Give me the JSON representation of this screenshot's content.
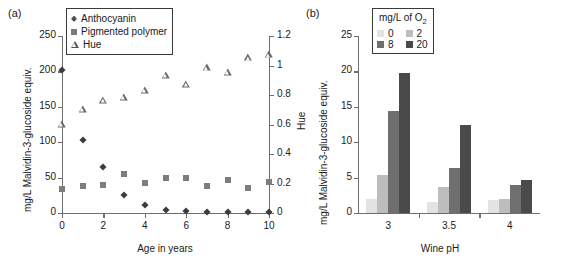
{
  "figure": {
    "panel_a_tag": "(a)",
    "panel_b_tag": "(b)"
  },
  "panel_a": {
    "legend": {
      "items": [
        {
          "label": "Anthocyanin",
          "marker": "filled-diamond",
          "color": "#3c3c3c"
        },
        {
          "label": "Pigmented polymer",
          "marker": "filled-square",
          "color": "#7d7d7d"
        },
        {
          "label": "Hue",
          "marker": "open-triangle",
          "color": "#6a6a6a"
        }
      ]
    },
    "chart_data": {
      "type": "scatter",
      "title": "",
      "xlabel": "Age in years",
      "ylabel": "mg/L Malvidin-3-glucoside equiv.",
      "y2label": "Hue",
      "xlim": [
        0,
        10
      ],
      "ylim": [
        0,
        250
      ],
      "y2lim": [
        0,
        1.2
      ],
      "xticks": [
        0,
        2,
        4,
        6,
        8,
        10
      ],
      "xticklabels": [
        "0",
        "2",
        "4",
        "6",
        "8",
        "10"
      ],
      "yticks": [
        0,
        50,
        100,
        150,
        200,
        250
      ],
      "yticklabels": [
        "0",
        "50",
        "100",
        "150",
        "200",
        "250"
      ],
      "y2ticks": [
        0,
        0.2,
        0.4,
        0.6,
        0.8,
        1,
        1.2
      ],
      "y2ticklabels": [
        "0",
        "0.2",
        "0.4",
        "0.6",
        "0.8",
        "1",
        "1.2"
      ],
      "grid": false,
      "legend_position": "upper-left-inside",
      "x": [
        0,
        1,
        2,
        3,
        4,
        5,
        6,
        7,
        8,
        9,
        10
      ],
      "series": [
        {
          "name": "Anthocyanin",
          "axis": "left",
          "marker": "filled-diamond",
          "values": [
            202,
            103,
            65,
            26,
            11,
            4,
            3,
            1,
            1,
            1,
            1
          ]
        },
        {
          "name": "Pigmented polymer",
          "axis": "left",
          "marker": "filled-square",
          "values": [
            34,
            38,
            40,
            55,
            43,
            49,
            49,
            38,
            47,
            36,
            44
          ]
        },
        {
          "name": "Hue",
          "axis": "right",
          "marker": "open-triangle",
          "values": [
            0.6,
            0.7,
            0.76,
            0.78,
            0.83,
            0.93,
            0.87,
            0.98,
            0.95,
            1.05,
            1.07
          ]
        }
      ]
    }
  },
  "panel_b": {
    "legend": {
      "title": "mg/L of O",
      "title_sub": "2",
      "items": [
        {
          "label": "0",
          "color": "#e3e3e3"
        },
        {
          "label": "2",
          "color": "#bdbdbd"
        },
        {
          "label": "8",
          "color": "#6f6f6f"
        },
        {
          "label": "20",
          "color": "#4a4a4a"
        }
      ]
    },
    "chart_data": {
      "type": "bar",
      "title": "",
      "xlabel": "Wine pH",
      "ylabel": "mg/L Malvidin-3-glucoside equiv.",
      "ylim": [
        0,
        25
      ],
      "yticks": [
        0,
        5,
        10,
        15,
        20,
        25
      ],
      "yticklabels": [
        "0",
        "5",
        "10",
        "15",
        "20",
        "25"
      ],
      "categories": [
        "3",
        "3.5",
        "4"
      ],
      "grid": false,
      "legend_position": "upper-center-inside",
      "series": [
        {
          "name": "0",
          "color": "#e3e3e3",
          "values": [
            2.0,
            1.6,
            1.9
          ]
        },
        {
          "name": "2",
          "color": "#bdbdbd",
          "values": [
            5.4,
            3.7,
            2.0
          ]
        },
        {
          "name": "8",
          "color": "#6f6f6f",
          "values": [
            14.4,
            6.4,
            3.9
          ]
        },
        {
          "name": "20",
          "color": "#4a4a4a",
          "values": [
            19.8,
            12.4,
            4.6
          ]
        }
      ]
    }
  }
}
